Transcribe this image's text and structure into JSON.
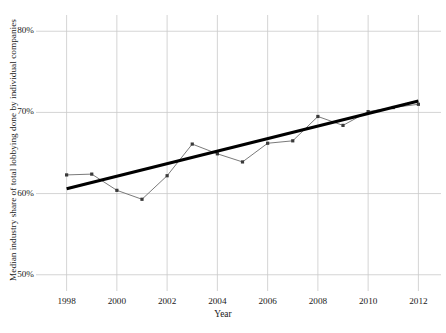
{
  "chart_data": {
    "type": "line",
    "title": "",
    "xlabel": "Year",
    "ylabel": "Median industry share of total lobbying done by individual companies",
    "x": [
      1998,
      1999,
      2000,
      2001,
      2002,
      2003,
      2004,
      2005,
      2006,
      2007,
      2008,
      2009,
      2010,
      2011,
      2012
    ],
    "series": [
      {
        "name": "Median industry share",
        "style": "line-with-markers",
        "color": "#6b6b6b",
        "marker_color": "#3a3a3a",
        "values": [
          62.3,
          62.4,
          60.4,
          59.3,
          62.2,
          66.1,
          64.9,
          63.9,
          66.2,
          66.5,
          69.5,
          68.4,
          70.1,
          70.6,
          71.0
        ]
      },
      {
        "name": "Linear trend",
        "style": "thick-trend-line",
        "color": "#000000",
        "endpoints": [
          {
            "x": 1998,
            "y": 60.6
          },
          {
            "x": 2012,
            "y": 71.4
          }
        ]
      }
    ],
    "xlim": [
      1997.1,
      2012.9
    ],
    "ylim": [
      48.0,
      82.0
    ],
    "xticks": [
      1998,
      2000,
      2002,
      2004,
      2006,
      2008,
      2010,
      2012
    ],
    "xtick_labels": [
      "1998",
      "2000",
      "2002",
      "2004",
      "2006",
      "2008",
      "2010",
      "2012"
    ],
    "yticks": [
      50,
      60,
      70,
      80
    ],
    "ytick_labels": [
      "50%",
      "60%",
      "70%",
      "80%"
    ],
    "grid": true,
    "grid_color": "#c9c9c9",
    "legend": "none",
    "background": "#ffffff"
  }
}
